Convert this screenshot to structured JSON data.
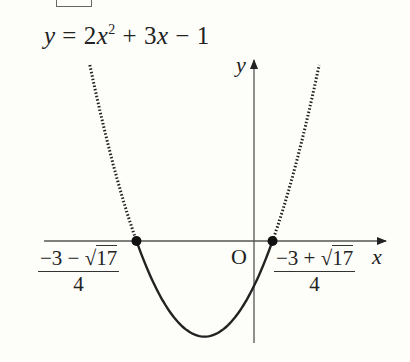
{
  "header_box": {
    "present": true
  },
  "equation": {
    "lhs": "y",
    "eq": "=",
    "a": "2",
    "var": "x",
    "exp": "2",
    "plus": "+",
    "b": "3",
    "var2": "x",
    "minus": "−",
    "c": "1",
    "full": "y = 2x² + 3x − 1"
  },
  "axes": {
    "x_label": "x",
    "y_label": "y",
    "origin_label": "O"
  },
  "roots": [
    {
      "label_num_pre": "−3 − √",
      "radicand": "17",
      "label_den": "4",
      "value": -1.781
    },
    {
      "label_num_pre": "−3 + √",
      "radicand": "17",
      "label_den": "4",
      "value": 0.281
    }
  ],
  "curve": {
    "a": 2,
    "b": 3,
    "c": -1,
    "solid_between_roots": true,
    "dotted_outside_roots": true,
    "vertex": {
      "x": -0.75,
      "y": -2.125
    },
    "color": "#222222"
  },
  "chart_data": {
    "type": "line",
    "xlabel": "x",
    "ylabel": "y",
    "function": "2x^2 + 3x - 1",
    "roots": [
      -1.781,
      0.281
    ],
    "vertex": [
      -0.75,
      -2.125
    ],
    "y_intercept": -1,
    "style": "solid segment between roots (y<=0), dotted outside",
    "grid": false
  }
}
